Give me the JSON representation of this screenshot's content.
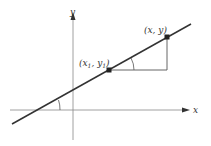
{
  "diagram": {
    "title": "",
    "axes": {
      "x_label": "x",
      "y_label": "y"
    },
    "points": [
      {
        "id": "p1",
        "label_main": "(x",
        "label_sub1": "1",
        "label_mid": ", y",
        "label_sub2": "1",
        "label_end": ")"
      },
      {
        "id": "p2",
        "label": "(x, y)"
      }
    ],
    "colors": {
      "line": "#333333",
      "axes": "#777777",
      "triangle": "#555555",
      "point": "#222222"
    }
  }
}
